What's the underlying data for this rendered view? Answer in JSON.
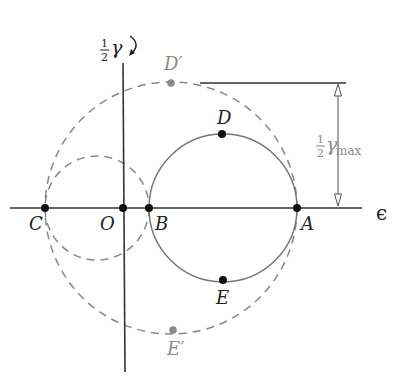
{
  "diagram": {
    "type": "mohr-circle-strain",
    "axes": {
      "horizontal_label": "ϵ",
      "vertical_label_frac_num": "1",
      "vertical_label_frac_den": "2",
      "vertical_label_symbol": "γ",
      "vertical_label_arrow": "↻"
    },
    "points": {
      "C": "C",
      "O": "O",
      "B": "B",
      "A": "A",
      "D": "D",
      "E": "E",
      "D_prime": "D′",
      "E_prime": "E′"
    },
    "dimension": {
      "frac_num": "1",
      "frac_den": "2",
      "symbol": "γ",
      "subscript": "max"
    },
    "circles": [
      {
        "name": "principal-circle-AB",
        "style": "solid"
      },
      {
        "name": "outer-circle-AC",
        "style": "dashed"
      },
      {
        "name": "inner-circle-BC",
        "style": "dashed"
      }
    ],
    "colors": {
      "axis": "#333333",
      "solid_circle": "#777777",
      "dashed_circle": "#888888",
      "point_black": "#111111",
      "point_gray": "#8a8a8a",
      "gray_label": "#8a8a8a"
    }
  }
}
